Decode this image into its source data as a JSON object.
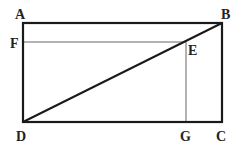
{
  "diagram": {
    "type": "geometry",
    "colors": {
      "outline": "#1a1a1a",
      "aux": "#9a9a9a",
      "label": "#222222"
    },
    "points": {
      "A": {
        "label": "A",
        "x": 23,
        "y": 23
      },
      "B": {
        "label": "B",
        "x": 222,
        "y": 23
      },
      "C": {
        "label": "C",
        "x": 222,
        "y": 122
      },
      "D": {
        "label": "D",
        "x": 23,
        "y": 122
      },
      "E": {
        "label": "E",
        "x": 186,
        "y": 42
      },
      "F": {
        "label": "F",
        "x": 23,
        "y": 42
      },
      "G": {
        "label": "G",
        "x": 186,
        "y": 122
      }
    },
    "segments": [
      {
        "from": "A",
        "to": "B",
        "style": "outline"
      },
      {
        "from": "B",
        "to": "C",
        "style": "outline"
      },
      {
        "from": "C",
        "to": "D",
        "style": "outline"
      },
      {
        "from": "D",
        "to": "A",
        "style": "outline"
      },
      {
        "from": "D",
        "to": "B",
        "style": "outline"
      },
      {
        "from": "F",
        "to": "E",
        "style": "aux"
      },
      {
        "from": "E",
        "to": "G",
        "style": "aux"
      }
    ],
    "labels": {
      "A": "A",
      "B": "B",
      "C": "C",
      "D": "D",
      "E": "E",
      "F": "F",
      "G": "G"
    }
  }
}
